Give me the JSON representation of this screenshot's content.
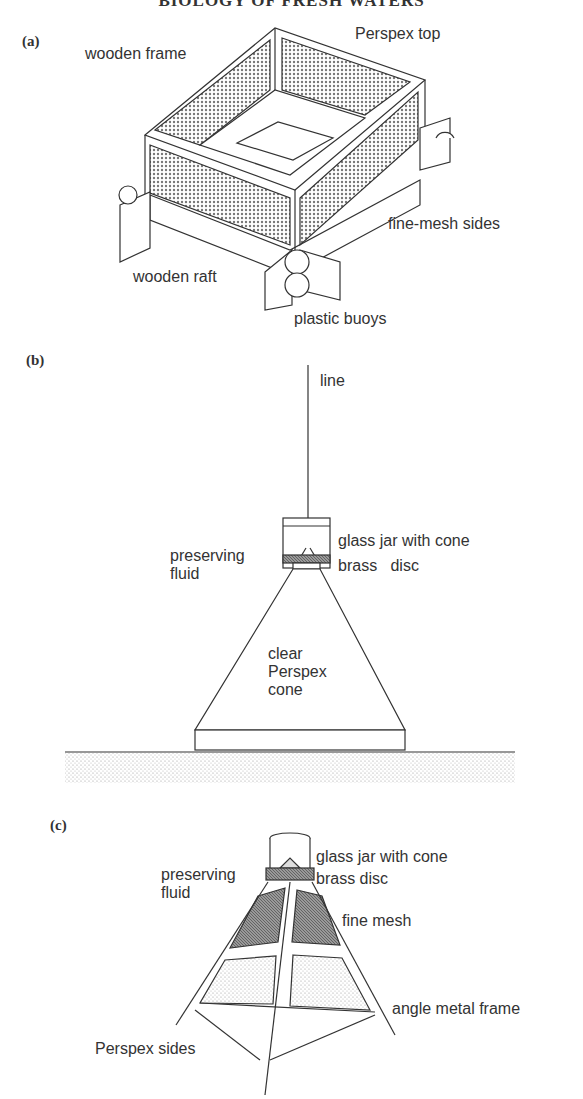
{
  "header": {
    "title": "BIOLOGY OF FRESH WATERS"
  },
  "panels": [
    {
      "id": "a",
      "label": "(a)",
      "labels": {
        "wooden_frame": "wooden frame",
        "perspex_top": "Perspex top",
        "fine_mesh_sides": "fine-mesh sides",
        "wooden_raft": "wooden raft",
        "plastic_buoys": "plastic buoys"
      }
    },
    {
      "id": "b",
      "label": "(b)",
      "labels": {
        "line": "line",
        "glass_jar": "glass jar with cone",
        "preserving_fluid_1": "preserving",
        "preserving_fluid_2": "fluid",
        "brass_disc": "brass   disc",
        "cone_1": "clear",
        "cone_2": "Perspex",
        "cone_3": "cone"
      }
    },
    {
      "id": "c",
      "label": "(c)",
      "labels": {
        "glass_jar": "glass jar with cone",
        "preserving_fluid_1": "preserving",
        "preserving_fluid_2": "fluid",
        "brass_disc": "brass disc",
        "fine_mesh": "fine mesh",
        "angle_metal_frame": "angle metal frame",
        "perspex_sides": "Perspex sides"
      }
    }
  ],
  "colors": {
    "ink": "#333333",
    "mesh": "#8a8a8a",
    "sediment": "#c8c8c8"
  }
}
